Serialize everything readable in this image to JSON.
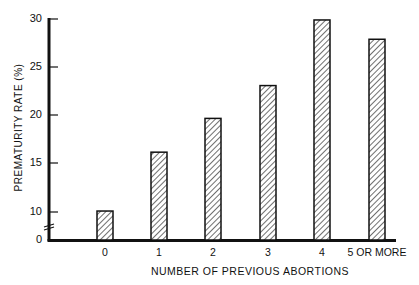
{
  "chart_data": {
    "type": "bar",
    "title": "",
    "xlabel": "NUMBER OF PREVIOUS ABORTIONS",
    "ylabel": "PREMATURITY RATE (%)",
    "categories": [
      "0",
      "1",
      "2",
      "3",
      "4",
      "5 OR MORE"
    ],
    "values": [
      10.1,
      16.2,
      19.7,
      23.1,
      29.9,
      27.9
    ],
    "ylim": [
      0,
      30
    ],
    "yticks": [
      "0",
      "10",
      "15",
      "20",
      "25",
      "30"
    ],
    "y_axis_break": "between 0 and 10",
    "grid": false,
    "bar_fill": "diagonal hatch",
    "legend": null
  },
  "axis": {
    "ylabel": "PREMATURITY RATE (%)",
    "xlabel": "NUMBER OF PREVIOUS ABORTIONS",
    "yticks": [
      {
        "label": "30",
        "y": 19
      },
      {
        "label": "25",
        "y": 67
      },
      {
        "label": "20",
        "y": 115
      },
      {
        "label": "15",
        "y": 163
      },
      {
        "label": "10",
        "y": 212
      },
      {
        "label": "0",
        "y": 240
      }
    ],
    "xticks": [
      {
        "label": "0",
        "cx": 105
      },
      {
        "label": "1",
        "cx": 159
      },
      {
        "label": "2",
        "cx": 213
      },
      {
        "label": "3",
        "cx": 268
      },
      {
        "label": "4",
        "cx": 322
      },
      {
        "label": "5 OR MORE",
        "cx": 377
      }
    ]
  }
}
